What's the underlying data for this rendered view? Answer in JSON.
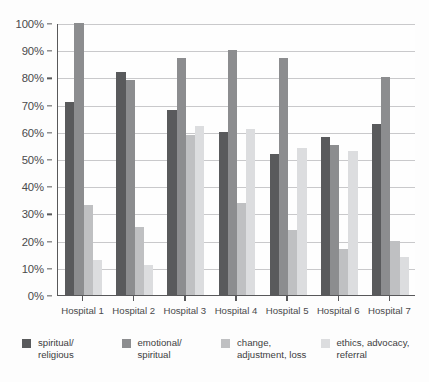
{
  "chart_data": {
    "type": "bar",
    "title": "",
    "subtitle": "",
    "xlabel": "",
    "ylabel": "",
    "ylim": [
      0,
      100
    ],
    "ytick_values": [
      0,
      10,
      20,
      30,
      40,
      50,
      60,
      70,
      80,
      90,
      100
    ],
    "ytick_labels": [
      "0%",
      "10%",
      "20%",
      "30%",
      "40%",
      "50%",
      "60%",
      "70%",
      "80%",
      "90%",
      "100%"
    ],
    "grid": true,
    "grid_axis": "y",
    "legend_position": "bottom",
    "categories": [
      "Hospital 1",
      "Hospital 2",
      "Hospital 3",
      "Hospital 4",
      "Hospital 5",
      "Hospital 6",
      "Hospital 7"
    ],
    "series": [
      {
        "name": "spiritual/\nreligious",
        "color": "#595a5c",
        "values": [
          71,
          82,
          68,
          60,
          52,
          58,
          63
        ]
      },
      {
        "name": "emotional/\nspiritual",
        "color": "#8c8d8f",
        "values": [
          100,
          79,
          87,
          90,
          87,
          55,
          80
        ]
      },
      {
        "name": "change,\nadjustment, loss",
        "color": "#bfc0c2",
        "values": [
          33,
          25,
          59,
          34,
          24,
          17,
          20
        ]
      },
      {
        "name": "ethics, advocacy,\nreferral",
        "color": "#dcdddf",
        "values": [
          13,
          11,
          62,
          61,
          54,
          53,
          14
        ]
      }
    ]
  }
}
